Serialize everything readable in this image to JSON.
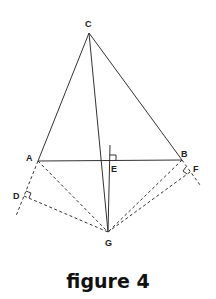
{
  "caption": "figure 4",
  "points": {
    "C": {
      "label": "C",
      "x": 89,
      "y": 33
    },
    "A": {
      "label": "A",
      "x": 38,
      "y": 161
    },
    "B": {
      "label": "B",
      "x": 182,
      "y": 160
    },
    "E": {
      "label": "E",
      "x": 111,
      "y": 161
    },
    "G": {
      "label": "G",
      "x": 108,
      "y": 232
    },
    "D": {
      "label": "D",
      "x": 24,
      "y": 196
    },
    "F": {
      "label": "F",
      "x": 190,
      "y": 172
    }
  },
  "solid_segments": [
    "CA",
    "CB",
    "CG",
    "AB",
    "EG-perpendicular"
  ],
  "dashed_segments": [
    "AD-extension",
    "BF-extension",
    "AG",
    "DG",
    "BG",
    "FG"
  ],
  "right_angles": [
    "E",
    "D",
    "F"
  ],
  "colors": {
    "stroke": "#333333",
    "text": "#222222"
  }
}
